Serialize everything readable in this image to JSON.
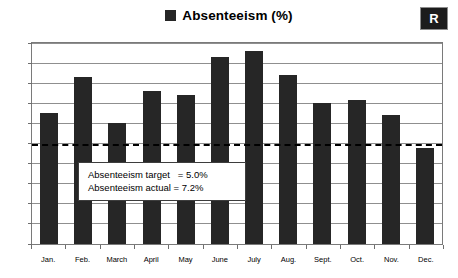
{
  "badge": {
    "label": "R"
  },
  "legend": {
    "marker": "legend-swatch-icon",
    "label": "Absenteeism (%)"
  },
  "annotation": {
    "line1": "Absenteeism target   = 5.0%",
    "line2": "Absenteeism actual = 7.2%"
  },
  "colors": {
    "bar": "#262626",
    "gridline": "#8f8f8f",
    "target_line": "#000000",
    "plot_border": "#7a7a7a",
    "badge_background": "#1c1c1c",
    "background": "#ffffff"
  },
  "chart_data": {
    "type": "bar",
    "title": "Absenteeism (%)",
    "xlabel": "",
    "ylabel": "",
    "ylim": [
      0,
      10
    ],
    "ytick_labels": [
      "10%",
      "9%",
      "8%",
      "7%",
      "6%",
      "5%",
      "4%",
      "3%",
      "2%",
      "1%",
      "0%"
    ],
    "ytick_values": [
      10,
      9,
      8,
      7,
      6,
      5,
      4,
      3,
      2,
      1,
      0
    ],
    "grid": true,
    "legend_position": "top-center",
    "categories": [
      "Jan.",
      "Feb.",
      "March",
      "April",
      "May",
      "June",
      "July",
      "Aug.",
      "Sept.",
      "Oct.",
      "Nov.",
      "Dec."
    ],
    "series": [
      {
        "name": "Absenteeism (%)",
        "values": [
          6.5,
          8.3,
          6.0,
          7.6,
          7.4,
          9.3,
          9.6,
          8.4,
          7.0,
          7.15,
          6.4,
          4.8
        ]
      }
    ],
    "annotations": [
      {
        "name": "target-line",
        "type": "hline",
        "value": 5.0,
        "style": "dashed",
        "label": "Absenteeism target = 5.0%"
      },
      {
        "name": "actual-average",
        "type": "text",
        "value": 7.2,
        "label": "Absenteeism actual = 7.2%"
      }
    ]
  }
}
